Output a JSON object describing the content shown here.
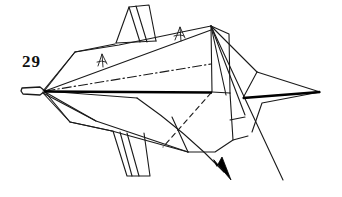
{
  "figure": {
    "kind": "origami-folding-diagram",
    "step_number_label": "29",
    "background_color": "#ffffff",
    "ink_color": "#1a1a1a",
    "width": 342,
    "height": 197
  },
  "elements": {
    "left_tip": {
      "name": "left-point-tip",
      "vertex": [
        43,
        91
      ],
      "outline": [
        [
          22,
          88
        ],
        [
          40,
          87
        ],
        [
          45,
          91
        ],
        [
          40,
          95
        ],
        [
          23,
          94
        ]
      ]
    },
    "right_spike": {
      "name": "right-point-spike",
      "apex": [
        320,
        92
      ]
    },
    "top_vertex": {
      "name": "top-apex-vertex",
      "point": [
        211,
        26
      ]
    },
    "center_spine": {
      "name": "center-spine-line",
      "from": [
        43,
        91
      ],
      "to": [
        212,
        92
      ],
      "style": "thick-solid"
    },
    "dash_dot_crease": {
      "name": "mountain-fold-crease",
      "from": [
        45,
        91
      ],
      "to": [
        211,
        64
      ],
      "style": "dash-dot"
    },
    "dashed_crease": {
      "name": "valley-fold-crease",
      "from": [
        211,
        93
      ],
      "to": [
        163,
        147
      ],
      "style": "dashed"
    },
    "action_arrow": {
      "name": "fold-direction-arrow",
      "path_start": [
        137,
        98
      ],
      "path_end": [
        228,
        176
      ],
      "arrowhead_at": [
        228,
        176
      ],
      "style": "curved-solid-with-solid-head"
    },
    "pleat_marks": [
      {
        "name": "pleat-mark-left",
        "at": [
          101,
          60
        ]
      },
      {
        "name": "pleat-mark-right",
        "at": [
          179,
          33
        ]
      }
    ],
    "top_fin": {
      "name": "upper-fin-flap",
      "outline": [
        [
          128,
          7
        ],
        [
          149,
          5
        ],
        [
          156,
          41
        ],
        [
          116,
          43
        ]
      ]
    },
    "bottom_fin": {
      "name": "lower-fin-flap",
      "outline": [
        [
          114,
          131
        ],
        [
          143,
          133
        ],
        [
          150,
          176
        ],
        [
          126,
          176
        ]
      ]
    }
  },
  "colors": {
    "ink": "#1a1a1a",
    "paper": "#ffffff",
    "thick_ink": "#000000"
  }
}
